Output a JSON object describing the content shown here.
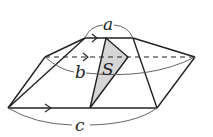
{
  "diagram": {
    "labels": {
      "top_edge": "a",
      "middle_edge": "b",
      "bottom_edge": "c",
      "shaded_region": "S"
    },
    "colors": {
      "stroke": "#222222",
      "shade": "#d6d6d6",
      "dim_line": "#555555"
    }
  }
}
